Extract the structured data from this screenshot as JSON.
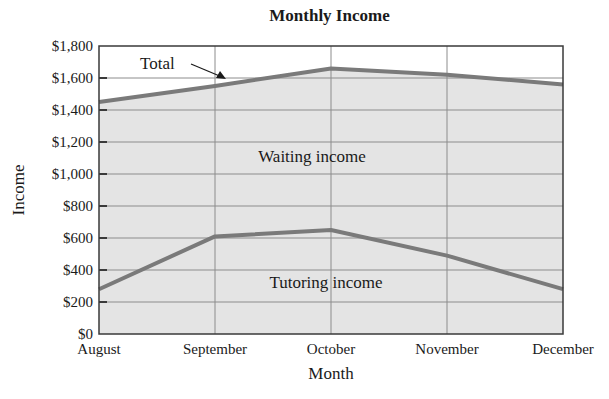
{
  "chart_data": {
    "type": "area",
    "title": "Monthly Income",
    "xlabel": "Month",
    "ylabel": "Income",
    "categories": [
      "August",
      "September",
      "October",
      "November",
      "December"
    ],
    "series": [
      {
        "name": "Total",
        "values": [
          1450,
          1550,
          1660,
          1620,
          1560
        ]
      },
      {
        "name": "Tutoring income",
        "values": [
          280,
          610,
          650,
          490,
          280
        ]
      }
    ],
    "derived_series": [
      {
        "name": "Waiting income",
        "values": [
          1170,
          940,
          1010,
          1130,
          1280
        ]
      }
    ],
    "ylim": [
      0,
      1800
    ],
    "yticks": [
      0,
      200,
      400,
      600,
      800,
      1000,
      1200,
      1400,
      1600,
      1800
    ],
    "ytick_labels": [
      "$0",
      "$200",
      "$400",
      "$600",
      "$800",
      "$1,000",
      "$1,200",
      "$1,400",
      "$1,600",
      "$1,800"
    ],
    "grid": true,
    "annotations": [
      {
        "text": "Total",
        "type": "arrow-label"
      },
      {
        "text": "Waiting income",
        "type": "region-label"
      },
      {
        "text": "Tutoring income",
        "type": "region-label"
      }
    ],
    "colors": {
      "line": "#7a7a7a",
      "fill": "#e4e4e4",
      "grid": "#8c8c8c",
      "frame": "#3a3a3a"
    }
  }
}
